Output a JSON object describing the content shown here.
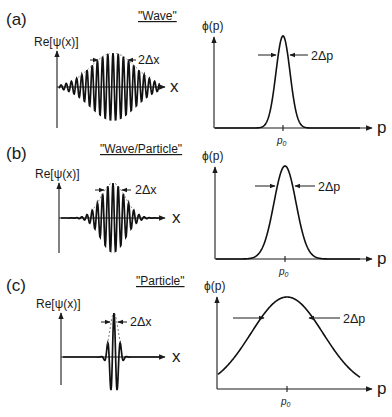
{
  "figure": {
    "panels": [
      {
        "tag": "(a)",
        "title": "\"Wave\"",
        "left": {
          "ylabel": "Re[ψ(x)]",
          "xlabel": "x",
          "width_label": "2Δx"
        },
        "right": {
          "ylabel": "ϕ(p)",
          "xlabel": "p",
          "width_label": "2Δp",
          "tick_label": "p0"
        }
      },
      {
        "tag": "(b)",
        "title": "\"Wave/Particle\"",
        "left": {
          "ylabel": "Re[ψ(x)]",
          "xlabel": "x",
          "width_label": "2Δx"
        },
        "right": {
          "ylabel": "ϕ(p)",
          "xlabel": "p",
          "width_label": "2Δp",
          "tick_label": "p0"
        }
      },
      {
        "tag": "(c)",
        "title": "\"Particle\"",
        "left": {
          "ylabel": "Re[ψ(x)]",
          "xlabel": "x",
          "width_label": "2Δx"
        },
        "right": {
          "ylabel": "ϕ(p)",
          "xlabel": "p",
          "width_label": "2Δp",
          "tick_label": "p0"
        }
      }
    ]
  },
  "geometry": {
    "left_panels": [
      {
        "axis_x": 57,
        "base_y": 87,
        "axis_top": 50,
        "axis_bottom": 128,
        "x_end": 166,
        "center": 113,
        "amp": 34,
        "sigma": 22,
        "period": 5.2,
        "halfwidth": 16
      },
      {
        "axis_x": 59,
        "base_y": 218,
        "axis_top": 181,
        "axis_bottom": 253,
        "x_end": 166,
        "center": 113,
        "amp": 35,
        "sigma": 12,
        "period": 5.2,
        "halfwidth": 10
      },
      {
        "axis_x": 61,
        "base_y": 357,
        "axis_top": 311,
        "axis_bottom": 385,
        "x_end": 166,
        "center": 114,
        "amp": 44,
        "sigma": 4.2,
        "period": 6.5,
        "halfwidth": 3
      }
    ],
    "right_panels": [
      {
        "axis_x": 214,
        "base_y": 128,
        "axis_top": 36,
        "x_end": 372,
        "center": 283,
        "peak_y": 36,
        "sigma": 7,
        "arrow_y": 55
      },
      {
        "axis_x": 215,
        "base_y": 259,
        "axis_top": 166,
        "x_end": 372,
        "center": 285,
        "peak_y": 166,
        "sigma": 11,
        "arrow_y": 186
      },
      {
        "axis_x": 217,
        "base_y": 389,
        "axis_top": 296,
        "x_end": 372,
        "center": 287,
        "peak_y": 297,
        "sigma": 36,
        "arrow_y": 318
      }
    ]
  },
  "chart_data": {
    "type": "line",
    "panels": [
      {
        "tag": "(a)",
        "label": "Wave",
        "position_space": "wide oscillating wave packet, many cycles",
        "momentum_space": "narrow Gaussian centered at p0",
        "relative_dx": "large",
        "relative_dp": "small"
      },
      {
        "tag": "(b)",
        "label": "Wave/Particle",
        "position_space": "medium wave packet",
        "momentum_space": "medium Gaussian centered at p0",
        "relative_dx": "medium",
        "relative_dp": "medium"
      },
      {
        "tag": "(c)",
        "label": "Particle",
        "position_space": "narrow spike, few cycles",
        "momentum_space": "broad Gaussian centered at p0",
        "relative_dx": "small",
        "relative_dp": "large"
      }
    ],
    "xlabel_left": "x",
    "ylabel_left": "Re[ψ(x)]",
    "xlabel_right": "p",
    "ylabel_right": "ϕ(p)",
    "grid": false
  }
}
